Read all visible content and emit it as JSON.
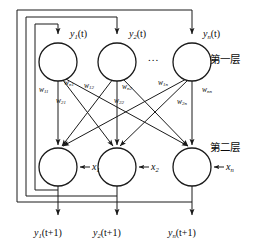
{
  "figure": {
    "type": "neural-network-diagram",
    "stroke_color": "#1a1a1a",
    "background_color": "#ffffff"
  },
  "layers": [
    {
      "id": "layer-1",
      "label": "第一层",
      "label_x": 210,
      "label_y": 60
    },
    {
      "id": "layer-2",
      "label": "第二层",
      "label_x": 210,
      "label_y": 148
    }
  ],
  "top_nodes": [
    {
      "id": "node-y1",
      "cx": 58,
      "cy": 62,
      "r": 19,
      "input_label": "y",
      "input_sub": "1",
      "input_arg": "(t)",
      "label_x": 70,
      "label_y": 34
    },
    {
      "id": "node-y2",
      "cx": 117,
      "cy": 62,
      "r": 19,
      "input_label": "y",
      "input_sub": "2",
      "input_arg": "(t)",
      "label_x": 129,
      "label_y": 34
    },
    {
      "id": "node-yn",
      "cx": 192,
      "cy": 62,
      "r": 19,
      "input_label": "y",
      "input_sub": "n",
      "input_arg": "(t)",
      "label_x": 203,
      "label_y": 34
    }
  ],
  "bottom_nodes": [
    {
      "id": "node-s1",
      "cx": 58,
      "cy": 167,
      "r": 19,
      "ext_input": "x",
      "ext_sub": "1",
      "label_x": 92,
      "label_y": 170
    },
    {
      "id": "node-s2",
      "cx": 117,
      "cy": 167,
      "r": 19,
      "ext_input": "x",
      "ext_sub": "2",
      "label_x": 151,
      "label_y": 170
    },
    {
      "id": "node-sn",
      "cx": 192,
      "cy": 167,
      "r": 19,
      "ext_input": "x",
      "ext_sub": "n",
      "label_x": 226,
      "label_y": 170
    }
  ],
  "ellipsis": {
    "text": "...",
    "x": 150,
    "y": 57
  },
  "weights": [
    {
      "id": "w11",
      "sym": "w",
      "sub": "11",
      "x": 39,
      "y": 90
    },
    {
      "id": "wn1",
      "sym": "w",
      "sub": "n1",
      "x": 64,
      "y": 83
    },
    {
      "id": "w21",
      "sym": "w",
      "sub": "21",
      "x": 56,
      "y": 101
    },
    {
      "id": "w12",
      "sym": "w",
      "sub": "12",
      "x": 84,
      "y": 86
    },
    {
      "id": "wn2",
      "sym": "w",
      "sub": "n2",
      "x": 122,
      "y": 87
    },
    {
      "id": "w22",
      "sym": "w",
      "sub": "22",
      "x": 114,
      "y": 101
    },
    {
      "id": "w1n",
      "sym": "w",
      "sub": "1n",
      "x": 158,
      "y": 83
    },
    {
      "id": "w2n",
      "sym": "w",
      "sub": "2n",
      "x": 177,
      "y": 102
    },
    {
      "id": "wnn",
      "sym": "w",
      "sub": "nn",
      "x": 202,
      "y": 90
    }
  ],
  "outputs": [
    {
      "id": "out-y1",
      "sym": "y",
      "sub": "1",
      "arg": "(t+1)",
      "x": 36,
      "y": 233
    },
    {
      "id": "out-y2",
      "sym": "y",
      "sub": "2",
      "arg": "(t+1)",
      "x": 95,
      "y": 233
    },
    {
      "id": "out-yn",
      "sym": "y",
      "sub": "n",
      "arg": "(t+1)",
      "x": 170,
      "y": 233
    }
  ],
  "feedback_loops": [
    {
      "id": "feedback-loop-1",
      "left": 35,
      "top": 24,
      "right": 58,
      "bottom": 190
    },
    {
      "id": "feedback-loop-2",
      "left": 26,
      "top": 17,
      "right": 117,
      "bottom": 196
    },
    {
      "id": "feedback-loop-3",
      "left": 17,
      "top": 10,
      "right": 192,
      "bottom": 202
    }
  ]
}
